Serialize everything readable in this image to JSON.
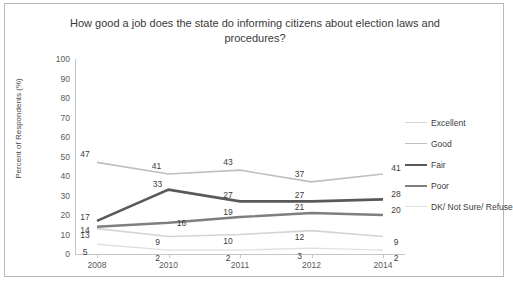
{
  "chart_data": {
    "type": "line",
    "title": "How good a job does the state do informing citizens about election laws and procedures?",
    "xlabel": "",
    "ylabel": "Percent of Respondents (%)",
    "ylim": [
      0,
      100
    ],
    "ytick_step": 10,
    "yticks": [
      "100",
      "90",
      "80",
      "70",
      "60",
      "50",
      "40",
      "30",
      "20",
      "10",
      "0"
    ],
    "categories": [
      "2008",
      "2010",
      "2011",
      "2012",
      "2014"
    ],
    "grid": false,
    "legend_position": "right",
    "series": [
      {
        "name": "Excellent",
        "values": [
          13,
          9,
          10,
          12,
          9
        ],
        "color": "#d4d4d4"
      },
      {
        "name": "Good",
        "values": [
          47,
          41,
          43,
          37,
          41
        ],
        "color": "#bfbfbf"
      },
      {
        "name": "Fair",
        "values": [
          17,
          33,
          27,
          27,
          28
        ],
        "color": "#595959"
      },
      {
        "name": "Poor",
        "values": [
          14,
          16,
          19,
          21,
          20
        ],
        "color": "#7f7f7f"
      },
      {
        "name": "DK/ Not Sure/ Refuse",
        "values": [
          5,
          2,
          2,
          3,
          2
        ],
        "color": "#e0e0e0"
      }
    ]
  },
  "colors": {
    "frame_border": "#b9b9b9",
    "axis": "#c5c5c5",
    "text": "#3c3c3c",
    "background": "#ffffff"
  }
}
